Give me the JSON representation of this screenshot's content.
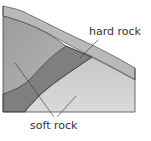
{
  "diagram": {
    "title": "",
    "labels": {
      "hard_rock": "hard rock",
      "soft_rock": "soft rock"
    },
    "colors": {
      "top_layer": "#b9b9b9",
      "soft_rock_dark": "#a3a3a3",
      "soft_rock_light": "#cfcfcf",
      "hard_rock_band": "#7f7f7f",
      "outline": "#333333"
    }
  }
}
